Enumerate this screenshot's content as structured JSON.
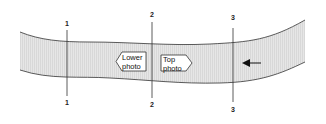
{
  "diagram": {
    "sections": [
      {
        "id": "1",
        "top_label": "1",
        "bottom_label": "1"
      },
      {
        "id": "2",
        "top_label": "2",
        "bottom_label": "2"
      },
      {
        "id": "3",
        "top_label": "3",
        "bottom_label": "3"
      }
    ],
    "boxes": {
      "lower": {
        "line1": "Lower",
        "line2": "photo",
        "direction": "left"
      },
      "top": {
        "line1": "Top",
        "line2": "photo",
        "direction": "right"
      }
    },
    "flow_arrow": {
      "direction": "left"
    },
    "colors": {
      "band_fill": "#e4e4e4",
      "line": "#333333"
    }
  }
}
